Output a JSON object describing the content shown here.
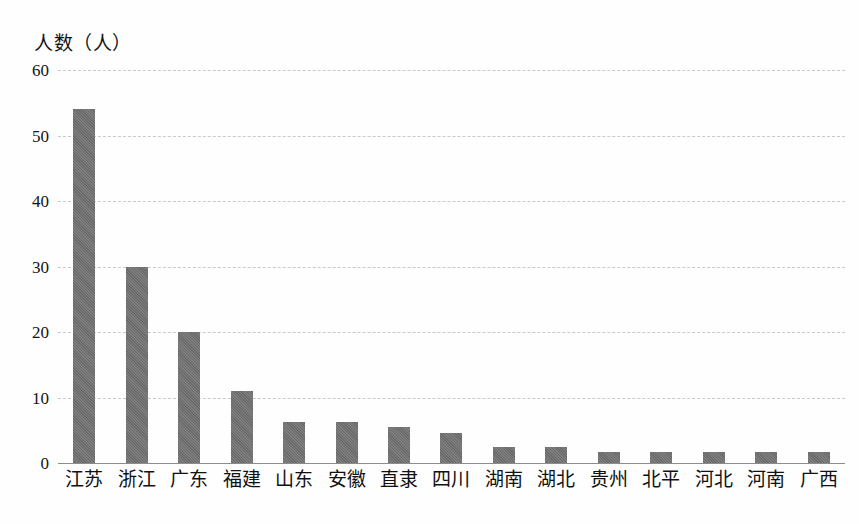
{
  "chart_data": {
    "type": "bar",
    "title": "",
    "subtitle": "",
    "xlabel": "",
    "ylabel": "人数（人）",
    "ylim": [
      0,
      60
    ],
    "ytick_values": [
      60,
      50,
      40,
      30,
      20,
      10,
      0
    ],
    "ytick_labels": [
      "60",
      "50",
      "40",
      "30",
      "20",
      "10",
      "0"
    ],
    "grid": true,
    "legend": null,
    "bar_color": "#6f6f6f",
    "gridline_color": "#c9c9cc",
    "axis_color": "#8c8c8c",
    "categories": [
      "江苏",
      "浙江",
      "广东",
      "福建",
      "山东",
      "安徽",
      "直隶",
      "四川",
      "湖南",
      "湖北",
      "贵州",
      "北平",
      "河北",
      "河南",
      "广西"
    ],
    "values": [
      54,
      30,
      20,
      11,
      6.3,
      6.3,
      5.5,
      4.6,
      2.5,
      2.5,
      1.7,
      1.7,
      1.7,
      1.7,
      1.7
    ],
    "series": [
      {
        "name": "人数",
        "values": [
          54,
          30,
          20,
          11,
          6.3,
          6.3,
          5.5,
          4.6,
          2.5,
          2.5,
          1.7,
          1.7,
          1.7,
          1.7,
          1.7
        ]
      }
    ]
  }
}
